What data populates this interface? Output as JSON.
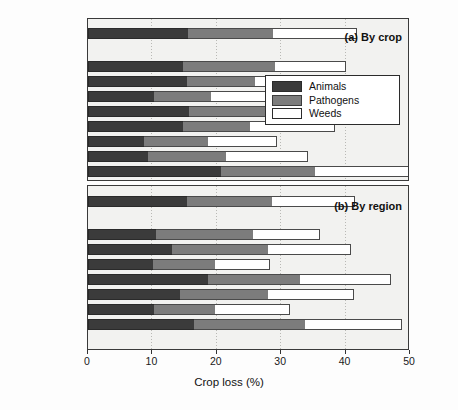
{
  "figure": {
    "xlabel": "Crop loss (%)",
    "panel_a_tag": "(a) By crop",
    "panel_b_tag": "(b) By region"
  },
  "legend": {
    "position": "inside-right-upper",
    "items": [
      {
        "label": "Animals",
        "color": "#3b3b3b",
        "key": "animals"
      },
      {
        "label": "Pathogens",
        "color": "#7c7c7c",
        "key": "pathogens"
      },
      {
        "label": "Weeds",
        "color": "#ffffff",
        "key": "weeds"
      }
    ]
  },
  "axis": {
    "ticks": [
      {
        "value": 0,
        "label": "0"
      },
      {
        "value": 10,
        "label": "10"
      },
      {
        "value": 20,
        "label": "20"
      },
      {
        "value": 30,
        "label": "30"
      },
      {
        "value": 40,
        "label": "40"
      },
      {
        "value": 50,
        "label": "50"
      }
    ],
    "min": 0,
    "max": 53
  },
  "chart_data": [
    {
      "type": "bar",
      "orientation": "horizontal",
      "stacked": true,
      "title": "(a) By crop",
      "xlabel": "Crop loss (%)",
      "ylabel": "",
      "xlim": [
        0,
        53
      ],
      "grid": true,
      "legend": [
        "Animals",
        "Pathogens",
        "Weeds"
      ],
      "legend_position": "inside right upper",
      "categories": [
        "Average",
        "Coffee",
        "Cotton",
        "Soybeans",
        "Potatoes",
        "Maize",
        "Barley",
        "Wheat",
        "Rice"
      ],
      "series": [
        {
          "name": "Animals",
          "values": [
            15.6,
            14.8,
            15.3,
            10.2,
            15.7,
            14.8,
            8.7,
            9.3,
            20.6
          ]
        },
        {
          "name": "Pathogens",
          "values": [
            13.1,
            14.3,
            10.7,
            8.9,
            16.6,
            10.4,
            9.9,
            12.2,
            14.7
          ]
        },
        {
          "name": "Weeds",
          "values": [
            13.0,
            11.0,
            11.3,
            12.9,
            5.8,
            13.1,
            10.7,
            12.6,
            15.6
          ]
        }
      ],
      "totals": [
        41.7,
        40.1,
        37.3,
        32.0,
        38.1,
        38.3,
        29.3,
        34.1,
        50.9
      ]
    },
    {
      "type": "bar",
      "orientation": "horizontal",
      "stacked": true,
      "title": "(b) By region",
      "xlabel": "Crop loss (%)",
      "ylabel": "",
      "xlim": [
        0,
        53
      ],
      "grid": true,
      "legend": [
        "Animals",
        "Pathogens",
        "Weeds"
      ],
      "categories": [
        "Average",
        "Oceania",
        "USSR",
        "Europe",
        "Asia",
        "Latin America",
        "N. America",
        "Africa"
      ],
      "series": [
        {
          "name": "Animals",
          "values": [
            15.3,
            10.6,
            13.1,
            10.1,
            18.7,
            14.3,
            10.2,
            16.4
          ]
        },
        {
          "name": "Pathogens",
          "values": [
            13.2,
            15.1,
            14.9,
            9.6,
            14.2,
            13.7,
            9.5,
            17.3
          ]
        },
        {
          "name": "Weeds",
          "values": [
            12.9,
            10.3,
            12.8,
            8.5,
            14.2,
            13.3,
            11.6,
            15.1
          ]
        }
      ],
      "totals": [
        41.4,
        36.0,
        40.8,
        28.2,
        47.1,
        41.3,
        31.3,
        48.8
      ]
    }
  ]
}
